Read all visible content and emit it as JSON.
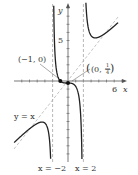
{
  "chart_data": {
    "type": "line",
    "title": "",
    "function": "y = (x^3 + 1)/(x^2 - 4)",
    "xlabel": "x",
    "ylabel": "y",
    "xlim": [
      -7,
      6.5
    ],
    "ylim": [
      -10,
      9.8
    ],
    "x_tick_labels": [
      "6"
    ],
    "y_tick_labels": [
      "5"
    ],
    "vertical_asymptotes": [
      {
        "x": -2,
        "label": "x = −2"
      },
      {
        "x": 2,
        "label": "x = 2"
      }
    ],
    "slant_asymptote": {
      "equation": "y = x",
      "label": "y = x"
    },
    "points": [
      {
        "x": -1,
        "y": 0,
        "label": "(−1, 0)"
      },
      {
        "x": 0,
        "y": -0.25,
        "label": "(0, −¼)"
      }
    ],
    "series": [
      {
        "name": "f(x)",
        "color": "#222222"
      }
    ],
    "colors": {
      "curve": "#222222",
      "axis": "#555555",
      "asymptote": "#888888"
    }
  },
  "labels": {
    "x_axis": "x",
    "y_axis": "y",
    "tick_x": "6",
    "tick_y": "5",
    "point_a": "(−1, 0)",
    "point_b_pre": "(0, −",
    "point_b_num": "1",
    "point_b_den": "4",
    "point_b_post": ")",
    "asym_left": "x = −2",
    "asym_right": "x = 2",
    "slant": "y = x"
  }
}
